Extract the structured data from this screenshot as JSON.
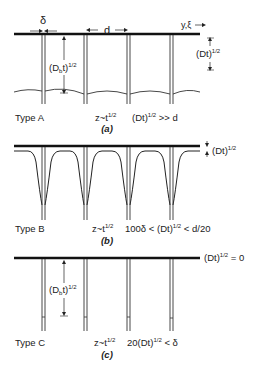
{
  "panels": [
    {
      "id": "a",
      "type_label": "Type A",
      "caption": "(a)",
      "growth_label": "z~t",
      "growth_exp": "1/2",
      "condition_pre": "(Dt)",
      "condition_exp": "1/2",
      "condition_post": " >> d",
      "delta_label": "δ",
      "spacing_label": "d",
      "axis_label": "y,ξ",
      "bulk_depth_label": "(Dt)",
      "bulk_depth_exp": "1/2",
      "gb_depth_label_pre": "(D",
      "gb_depth_label_sub": "b",
      "gb_depth_label_post": "t)",
      "gb_depth_exp": "1/2"
    },
    {
      "id": "b",
      "type_label": "Type B",
      "caption": "(b)",
      "growth_label": "z~t",
      "growth_exp": "1/2",
      "condition_pre": "100δ < (Dt)",
      "condition_exp": "1/2",
      "condition_post": " < d/20",
      "bulk_depth_label": "(Dt)",
      "bulk_depth_exp": "1/2"
    },
    {
      "id": "c",
      "type_label": "Type C",
      "caption": "(c)",
      "growth_label": "z~t",
      "growth_exp": "1/2",
      "condition_pre": "20(Dt)",
      "condition_exp": "1/2",
      "condition_post": " < δ",
      "bulk_label_pre": "(Dt)",
      "bulk_label_exp": "1/2",
      "bulk_label_post": " = 0",
      "gb_depth_label_pre": "(D",
      "gb_depth_label_sub": "b",
      "gb_depth_label_post": "t)",
      "gb_depth_exp": "1/2"
    }
  ]
}
